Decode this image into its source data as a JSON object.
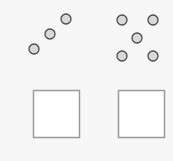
{
  "colors": {
    "background": "#f7f7f7",
    "dot_fill": "#d9d9d9",
    "dot_stroke": "#4a4a4a",
    "box_fill": "#ffffff",
    "box_stroke": "#9a9a9a"
  },
  "groups": [
    {
      "name": "three-dots",
      "count": 3,
      "dots": [
        {
          "cx": 34,
          "cy": 49
        },
        {
          "cx": 50,
          "cy": 34
        },
        {
          "cx": 66,
          "cy": 19
        }
      ]
    },
    {
      "name": "five-dots",
      "count": 5,
      "dots": [
        {
          "cx": 122,
          "cy": 20
        },
        {
          "cx": 153,
          "cy": 20
        },
        {
          "cx": 137,
          "cy": 38
        },
        {
          "cx": 122,
          "cy": 56
        },
        {
          "cx": 153,
          "cy": 56
        }
      ]
    }
  ],
  "boxes": [
    {
      "name": "left-answer-box",
      "x": 33,
      "y": 90,
      "w": 46,
      "h": 47
    },
    {
      "name": "right-answer-box",
      "x": 118,
      "y": 90,
      "w": 46,
      "h": 47
    }
  ],
  "dot_radius": 5
}
